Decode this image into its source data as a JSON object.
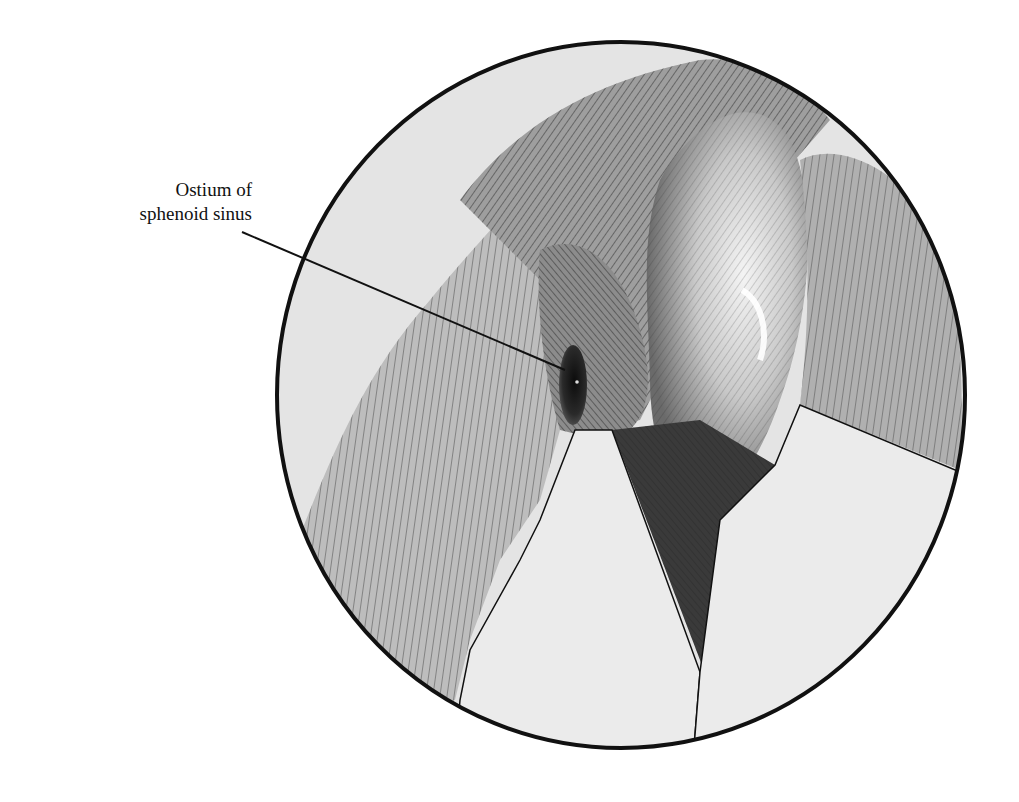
{
  "figure": {
    "type": "endoscopic-view-illustration",
    "style": "pen-and-ink cross-hatching, monochrome",
    "labels": [
      {
        "id": "ostium-label",
        "lines": [
          "Ostium of",
          "sphenoid sinus"
        ],
        "pointer_target": "ostium"
      }
    ],
    "colors": {
      "ink": "#111111",
      "background": "#ffffff",
      "tissue_light": "#e6e6e6",
      "tissue_mid": "#b5b5b5",
      "tissue_dark": "#5a5a5a",
      "ostium": "#1a1a1a",
      "instrument": "#ebebeb"
    },
    "view_circle": {
      "cx": 621,
      "cy": 395,
      "rx": 344,
      "ry": 353
    },
    "pointer_line": {
      "x1": 242,
      "y1": 232,
      "x2": 565,
      "y2": 370
    }
  }
}
